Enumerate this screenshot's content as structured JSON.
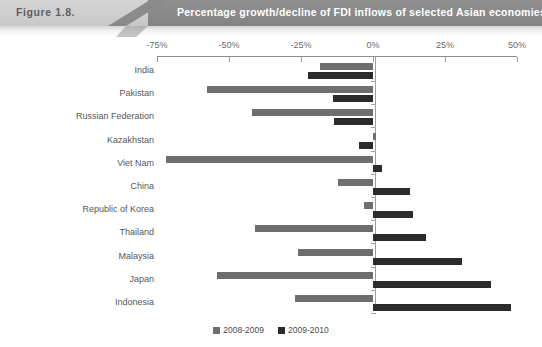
{
  "header": {
    "figure_number": "Figure 1.8.",
    "title": "Percentage growth/decline of FDI inflows of selected Asian economies, 2008/09 versus 2009/10"
  },
  "legend": {
    "items": [
      {
        "label": "2008-2009",
        "color": "#6e6e6e"
      },
      {
        "label": "2009-2010",
        "color": "#2b2b2b"
      }
    ]
  },
  "chart_data": {
    "type": "bar",
    "orientation": "horizontal",
    "title": "Percentage growth/decline of FDI inflows of selected Asian economies, 2008/09 versus 2009/10",
    "xlabel": "",
    "ylabel": "",
    "xlim": [
      -75,
      50
    ],
    "xticks": [
      -75,
      -50,
      -25,
      0,
      25,
      50
    ],
    "xtick_labels": [
      "-75%",
      "-50%",
      "-25%",
      "0%",
      "25%",
      "50%"
    ],
    "grid": false,
    "legend_position": "bottom",
    "categories": [
      "India",
      "Pakistan",
      "Russian Federation",
      "Kazakhstan",
      "Viet Nam",
      "China",
      "Republic of Korea",
      "Thailand",
      "Malaysia",
      "Japan",
      "Indonesia"
    ],
    "series": [
      {
        "name": "2008-2009",
        "color": "#6e6e6e",
        "values": [
          -18.5,
          -57.5,
          -42,
          1,
          -72,
          -12,
          -3,
          -41,
          -26,
          -54,
          -27
        ]
      },
      {
        "name": "2009-2010",
        "color": "#2b2b2b",
        "values": [
          -22.5,
          -14,
          -13.5,
          -5,
          3,
          13,
          14,
          18.5,
          31,
          41,
          48
        ]
      }
    ]
  }
}
